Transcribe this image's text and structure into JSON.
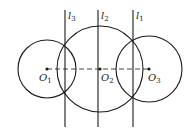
{
  "diagram": {
    "stroke_color": "#1a1a1a",
    "lines": [
      {
        "id": "l3",
        "label": "l",
        "sub": "3",
        "x": 65
      },
      {
        "id": "l2",
        "label": "l",
        "sub": "2",
        "x": 98
      },
      {
        "id": "l1",
        "label": "l",
        "sub": "1",
        "x": 133
      }
    ],
    "circles": [
      {
        "id": "O1",
        "label": "O",
        "sub": "1",
        "cx": 47,
        "cy": 69,
        "r": 29
      },
      {
        "id": "O2",
        "label": "O",
        "sub": "2",
        "cx": 100,
        "cy": 69,
        "r": 43
      },
      {
        "id": "O3",
        "label": "O",
        "sub": "3",
        "cx": 149,
        "cy": 69,
        "r": 33
      }
    ],
    "center_line": {
      "style": "dashed",
      "from": "O1",
      "to": "O3"
    }
  }
}
